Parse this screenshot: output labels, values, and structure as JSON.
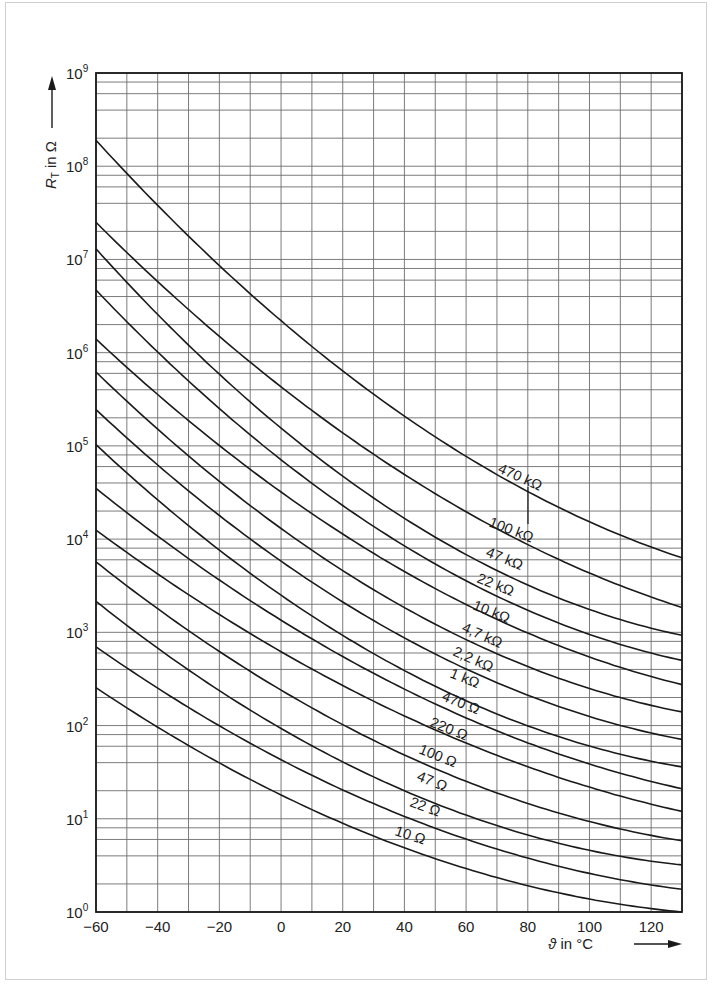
{
  "chart_data": {
    "type": "line",
    "title": "",
    "xlabel": "ϑ in °C",
    "ylabel": "R_T in Ω",
    "xlim": [
      -60,
      130
    ],
    "ylim": [
      1,
      1000000000
    ],
    "yscale": "log",
    "grid": true,
    "x_ticks": [
      -60,
      -40,
      -20,
      0,
      20,
      40,
      60,
      80,
      100,
      120
    ],
    "x_tick_labels": [
      "−60",
      "−40",
      "−20",
      "0",
      "20",
      "40",
      "60",
      "80",
      "100",
      "120"
    ],
    "y_ticks": [
      1,
      10,
      100,
      1000,
      10000,
      100000,
      1000000,
      10000000,
      100000000,
      1000000000
    ],
    "y_tick_labels": [
      {
        "base": "10",
        "exp": "0"
      },
      {
        "base": "10",
        "exp": "1"
      },
      {
        "base": "10",
        "exp": "2"
      },
      {
        "base": "10",
        "exp": "3"
      },
      {
        "base": "10",
        "exp": "4"
      },
      {
        "base": "10",
        "exp": "5"
      },
      {
        "base": "10",
        "exp": "6"
      },
      {
        "base": "10",
        "exp": "7"
      },
      {
        "base": "10",
        "exp": "8"
      },
      {
        "base": "10",
        "exp": "9"
      }
    ],
    "minor_y_grid_multipliers": [
      2,
      4,
      6,
      8
    ],
    "x_grid_step": 10,
    "x": [
      -60,
      0,
      130
    ],
    "series": [
      {
        "name": "470 kΩ",
        "values": [
          190000000,
          2200000,
          6300
        ]
      },
      {
        "name": "100 kΩ",
        "values": [
          25000000,
          430000,
          1850
        ]
      },
      {
        "name": "47 kΩ",
        "values": [
          13000000,
          155000,
          930
        ]
      },
      {
        "name": "22 kΩ",
        "values": [
          4700000,
          71000,
          500
        ]
      },
      {
        "name": "10 kΩ",
        "values": [
          1400000,
          32000,
          275
        ]
      },
      {
        "name": "4,7 kΩ",
        "values": [
          620000,
          13000,
          140
        ]
      },
      {
        "name": "2,2 kΩ",
        "values": [
          245000,
          5800,
          71
        ]
      },
      {
        "name": "1 kΩ",
        "values": [
          103000,
          2500,
          36
        ]
      },
      {
        "name": "470 Ω",
        "values": [
          35000,
          1350,
          21
        ]
      },
      {
        "name": "220 Ω",
        "values": [
          12500,
          620,
          12
        ]
      },
      {
        "name": "100 Ω",
        "values": [
          5700,
          240,
          5.8
        ]
      },
      {
        "name": "47 Ω",
        "values": [
          2150,
          93,
          3.2
        ]
      },
      {
        "name": "22 Ω",
        "values": [
          700,
          43,
          1.75
        ]
      },
      {
        "name": "10 Ω",
        "values": [
          255,
          18,
          1.0
        ]
      }
    ],
    "curve_label_positions": [
      {
        "name": "470 kΩ",
        "x": 497,
        "y": 472,
        "angle": 24
      },
      {
        "name": "100 kΩ",
        "x": 488,
        "y": 526,
        "angle": 21
      },
      {
        "name": "47 kΩ",
        "x": 485,
        "y": 556,
        "angle": 22
      },
      {
        "name": "22 kΩ",
        "x": 476,
        "y": 582,
        "angle": 22
      },
      {
        "name": "10 kΩ",
        "x": 472,
        "y": 609,
        "angle": 22
      },
      {
        "name": "4,7 kΩ",
        "x": 461,
        "y": 631,
        "angle": 24
      },
      {
        "name": "2,2 kΩ",
        "x": 452,
        "y": 655,
        "angle": 24
      },
      {
        "name": "1 kΩ",
        "x": 449,
        "y": 677,
        "angle": 22
      },
      {
        "name": "470 Ω",
        "x": 441,
        "y": 700,
        "angle": 22
      },
      {
        "name": "220 Ω",
        "x": 429,
        "y": 726,
        "angle": 22
      },
      {
        "name": "100 Ω",
        "x": 418,
        "y": 753,
        "angle": 22
      },
      {
        "name": "47 Ω",
        "x": 416,
        "y": 780,
        "angle": 22
      },
      {
        "name": "22 Ω",
        "x": 409,
        "y": 806,
        "angle": 20
      },
      {
        "name": "10 Ω",
        "x": 394,
        "y": 835,
        "angle": 18
      }
    ],
    "annotations": [
      {
        "type": "leader-line",
        "from_label": "100 kΩ",
        "to_curve": "470 kΩ",
        "x": 528
      }
    ]
  },
  "axes": {
    "x_title_symbol": "ϑ",
    "x_title_rest": " in °C",
    "y_title_main": "R",
    "y_title_sub": "T",
    "y_title_rest": " in Ω"
  }
}
